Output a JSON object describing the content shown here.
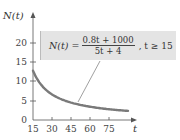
{
  "chart_data": {
    "type": "line",
    "title": "",
    "xlabel": "t",
    "ylabel": "N(t)",
    "xlim": [
      15,
      95
    ],
    "ylim": [
      0,
      24
    ],
    "grid": false,
    "x_ticks": [
      "15",
      "30",
      "45",
      "60",
      "75"
    ],
    "y_ticks": [
      "0",
      "5",
      "10",
      "15",
      "20"
    ],
    "series": [
      {
        "name": "N(t) = (0.8t + 1000)/(5t + 4)",
        "x": [
          15,
          30,
          45,
          60,
          75,
          90
        ],
        "values": [
          12.81,
          6.65,
          4.52,
          3.45,
          2.8,
          2.36
        ]
      }
    ],
    "annotation": {
      "lhs": "N(t) =",
      "numerator": "0.8t + 1000",
      "denominator": "5t + 4",
      "condition": ", t ≥ 15"
    }
  },
  "colors": {
    "curve": "#7a7a7a",
    "box_fill": "#e4e4e4",
    "axis": "#555555"
  }
}
